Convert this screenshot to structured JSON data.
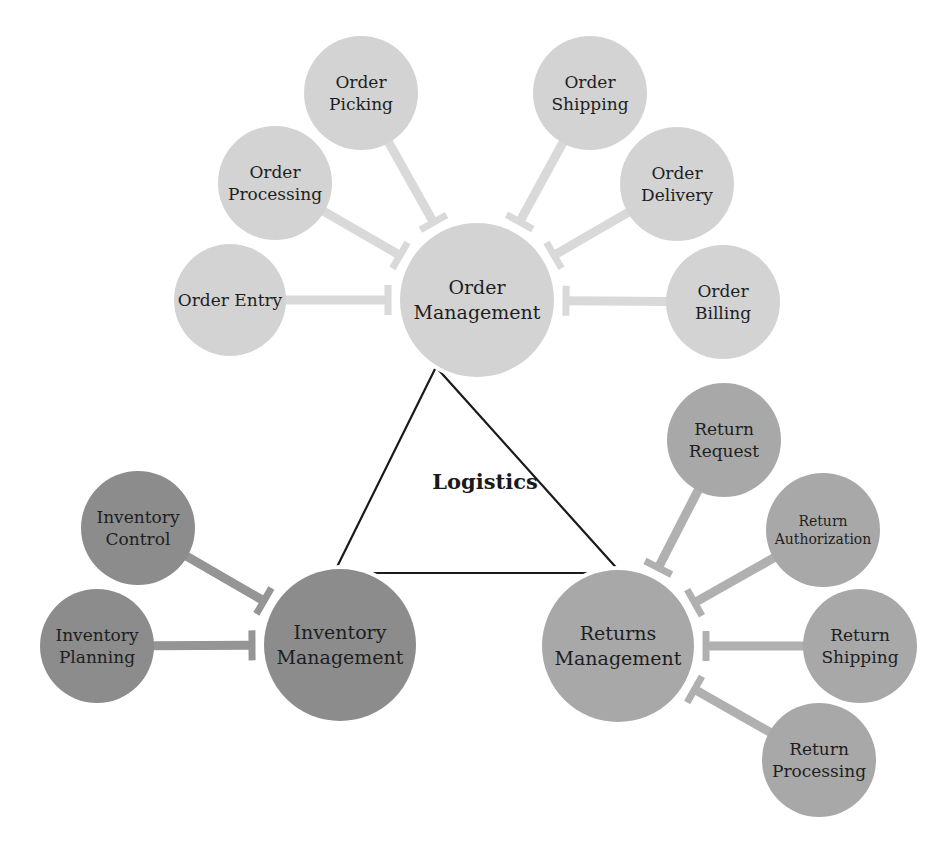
{
  "title": "Logistics",
  "colors": {
    "order": "#d3d3d3",
    "order_connector": "#d9d9d9",
    "inventory": "#8c8c8c",
    "inventory_connector": "#959595",
    "returns": "#a8a8a8",
    "returns_connector": "#b0b0b0",
    "triangle": "#1a1a1a",
    "text": "#1e1e1e"
  },
  "triangle": {
    "points": [
      [
        436,
        367
      ],
      [
        334,
        573
      ],
      [
        621,
        573
      ]
    ]
  },
  "hubs": [
    {
      "id": "order-management",
      "lines": [
        "Order",
        "Management"
      ],
      "cx": 477,
      "cy": 300,
      "r": 77,
      "group": "order"
    },
    {
      "id": "inventory-management",
      "lines": [
        "Inventory",
        "Management"
      ],
      "cx": 340,
      "cy": 645,
      "r": 76,
      "group": "inventory"
    },
    {
      "id": "returns-management",
      "lines": [
        "Returns",
        "Management"
      ],
      "cx": 618,
      "cy": 646,
      "r": 76,
      "group": "returns"
    }
  ],
  "satellites": [
    {
      "id": "order-entry",
      "hub": 0,
      "lines": [
        "Order Entry"
      ],
      "cx": 230,
      "cy": 300,
      "r": 56,
      "group": "order"
    },
    {
      "id": "order-processing",
      "hub": 0,
      "lines": [
        "Order",
        "Processing"
      ],
      "cx": 275,
      "cy": 183,
      "r": 57,
      "group": "order"
    },
    {
      "id": "order-picking",
      "hub": 0,
      "lines": [
        "Order",
        "Picking"
      ],
      "cx": 361,
      "cy": 93,
      "r": 57,
      "group": "order"
    },
    {
      "id": "order-shipping",
      "hub": 0,
      "lines": [
        "Order",
        "Shipping"
      ],
      "cx": 590,
      "cy": 93,
      "r": 57,
      "group": "order"
    },
    {
      "id": "order-delivery",
      "hub": 0,
      "lines": [
        "Order",
        "Delivery"
      ],
      "cx": 677,
      "cy": 184,
      "r": 57,
      "group": "order"
    },
    {
      "id": "order-billing",
      "hub": 0,
      "lines": [
        "Order",
        "Billing"
      ],
      "cx": 723,
      "cy": 302,
      "r": 57,
      "group": "order"
    },
    {
      "id": "inventory-control",
      "hub": 1,
      "lines": [
        "Inventory",
        "Control"
      ],
      "cx": 138,
      "cy": 528,
      "r": 57,
      "group": "inventory"
    },
    {
      "id": "inventory-planning",
      "hub": 1,
      "lines": [
        "Inventory",
        "Planning"
      ],
      "cx": 97,
      "cy": 646,
      "r": 57,
      "group": "inventory"
    },
    {
      "id": "return-request",
      "hub": 2,
      "lines": [
        "Return",
        "Request"
      ],
      "cx": 724,
      "cy": 440,
      "r": 57,
      "group": "returns"
    },
    {
      "id": "return-authorization",
      "hub": 2,
      "lines": [
        "Return",
        "Authorization"
      ],
      "cx": 823,
      "cy": 530,
      "r": 57,
      "group": "returns",
      "small": true
    },
    {
      "id": "return-shipping",
      "hub": 2,
      "lines": [
        "Return",
        "Shipping"
      ],
      "cx": 860,
      "cy": 646,
      "r": 57,
      "group": "returns"
    },
    {
      "id": "return-processing",
      "hub": 2,
      "lines": [
        "Return",
        "Processing"
      ],
      "cx": 819,
      "cy": 760,
      "r": 57,
      "group": "returns"
    }
  ]
}
